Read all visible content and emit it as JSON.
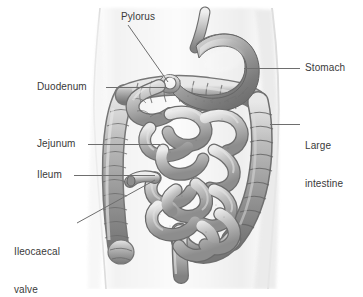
{
  "figure": {
    "view": "anterior torso, semi-transparent body outline",
    "background_color": "#ffffff",
    "line_color": "#6e6e6e",
    "text_color": "#3a3a3a"
  },
  "labels": [
    {
      "id": "pylorus",
      "text": "Pylorus",
      "x": 121,
      "y": 11,
      "leader": {
        "type": "diagonal",
        "x1": 128,
        "y1": 25,
        "x2": 168,
        "y2": 82
      }
    },
    {
      "id": "stomach",
      "text": "Stomach",
      "x": 305,
      "y": 62,
      "leader": {
        "type": "horizontal",
        "x1": 244,
        "y1": 68,
        "x2": 300,
        "y2": 68
      }
    },
    {
      "id": "duodenum",
      "text": "Duodenum",
      "x": 37,
      "y": 81,
      "leader": {
        "type": "horizontal",
        "x1": 106,
        "y1": 87,
        "x2": 167,
        "y2": 87
      }
    },
    {
      "id": "large-intestine",
      "text": "Large\nintestine",
      "line1": "Large",
      "line2": "intestine",
      "x": 305,
      "y": 115,
      "leader": {
        "type": "horizontal",
        "x1": 270,
        "y1": 124,
        "x2": 300,
        "y2": 124
      }
    },
    {
      "id": "jejunum",
      "text": "Jejunum",
      "x": 37,
      "y": 138,
      "leader": {
        "type": "horizontal",
        "x1": 88,
        "y1": 144,
        "x2": 160,
        "y2": 144
      }
    },
    {
      "id": "ileum",
      "text": "Ileum",
      "x": 37,
      "y": 169,
      "leader": {
        "type": "horizontal",
        "x1": 74,
        "y1": 175,
        "x2": 155,
        "y2": 175
      }
    },
    {
      "id": "ileocaecal-valve",
      "text": "Ileocaecal\nvalve",
      "line1": "Ileocaecal",
      "line2": "valve",
      "x": 14,
      "y": 221,
      "leader": {
        "type": "diagonal",
        "x1": 77,
        "y1": 223,
        "x2": 155,
        "y2": 180
      }
    }
  ],
  "organs": [
    {
      "id": "torso",
      "name": "body-outline",
      "shade": "#f2f2f2"
    },
    {
      "id": "stomach",
      "name": "stomach",
      "shade": "#8e8e8e"
    },
    {
      "id": "pylorus",
      "name": "pylorus",
      "shade": "#9a9a9a"
    },
    {
      "id": "duodenum",
      "name": "duodenum",
      "shade": "#a6a6a6"
    },
    {
      "id": "jejunum",
      "name": "jejunum",
      "shade": "#adadad"
    },
    {
      "id": "ileum",
      "name": "ileum",
      "shade": "#b2b2b2"
    },
    {
      "id": "large-intestine",
      "name": "large-intestine",
      "shade": "#a0a0a0"
    },
    {
      "id": "rectum",
      "name": "rectum",
      "shade": "#9d9d9d"
    }
  ]
}
